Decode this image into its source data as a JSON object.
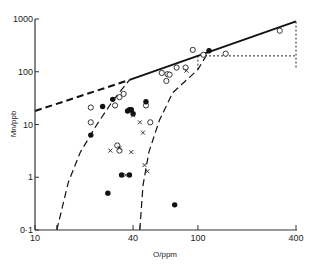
{
  "chart_data": {
    "type": "scatter",
    "title": "",
    "xlabel": "O/ppm",
    "ylabel": "Mn/ppb",
    "xscale": "log",
    "yscale": "log",
    "xlim": [
      10,
      400
    ],
    "ylim": [
      0.1,
      1000
    ],
    "grid": false,
    "legend": null,
    "x_ticks": [
      {
        "value": 10,
        "label": "10"
      },
      {
        "value": 40,
        "label": "40"
      },
      {
        "value": 100,
        "label": "100"
      },
      {
        "value": 400,
        "label": "400"
      }
    ],
    "x_minor_ticks": [
      13.6,
      44
    ],
    "y_ticks": [
      {
        "value": 1000,
        "label": "1000"
      },
      {
        "value": 100,
        "label": "100"
      },
      {
        "value": 10,
        "label": "10"
      },
      {
        "value": 1,
        "label": "1"
      },
      {
        "value": 0.1,
        "label": "0·1"
      }
    ],
    "series": [
      {
        "name": "open circles",
        "marker": "open-circle",
        "points": [
          [
            22,
            21
          ],
          [
            22,
            11
          ],
          [
            31,
            23
          ],
          [
            33,
            33
          ],
          [
            35,
            38
          ],
          [
            32,
            4.0
          ],
          [
            33,
            3.2
          ],
          [
            48,
            23
          ],
          [
            51,
            11
          ],
          [
            60,
            95
          ],
          [
            64,
            67
          ],
          [
            65,
            90
          ],
          [
            67,
            88
          ],
          [
            74,
            120
          ],
          [
            84,
            120
          ],
          [
            93,
            260
          ],
          [
            108,
            210
          ],
          [
            148,
            220
          ],
          [
            318,
            600
          ]
        ]
      },
      {
        "name": "filled circles",
        "marker": "filled-circle",
        "points": [
          [
            22,
            6.3
          ],
          [
            26,
            22
          ],
          [
            30,
            30
          ],
          [
            37,
            18
          ],
          [
            38,
            19
          ],
          [
            39,
            19
          ],
          [
            40,
            16
          ],
          [
            48,
            27
          ],
          [
            28,
            0.5
          ],
          [
            34,
            1.1
          ],
          [
            38,
            1.1
          ],
          [
            72,
            0.3
          ],
          [
            117,
            250
          ]
        ]
      },
      {
        "name": "crosses",
        "marker": "cross",
        "points": [
          [
            40,
            15
          ],
          [
            44,
            11
          ],
          [
            46,
            7
          ],
          [
            33,
            3.6
          ],
          [
            29,
            3.2
          ],
          [
            39,
            3.0
          ],
          [
            36,
            1.1
          ],
          [
            47,
            1.7
          ],
          [
            49,
            1.3
          ],
          [
            85,
            105
          ]
        ]
      }
    ],
    "lines": [
      {
        "name": "dashed upper boundary",
        "style": "dashed",
        "points": [
          [
            10,
            18
          ],
          [
            38,
            70
          ]
        ]
      },
      {
        "name": "solid upper boundary",
        "style": "solid",
        "points": [
          [
            38,
            70
          ],
          [
            400,
            900
          ]
        ]
      },
      {
        "name": "left dashed curve",
        "style": "dashed",
        "points": [
          [
            13.6,
            0.1
          ],
          [
            16,
            0.8
          ],
          [
            19,
            3
          ],
          [
            24,
            10
          ],
          [
            30,
            28
          ],
          [
            38,
            70
          ]
        ]
      },
      {
        "name": "right dashed curve",
        "style": "dashed",
        "points": [
          [
            44,
            0.1
          ],
          [
            46,
            0.7
          ],
          [
            50,
            3
          ],
          [
            58,
            12
          ],
          [
            70,
            40
          ],
          [
            100,
            110
          ],
          [
            117,
            250
          ]
        ]
      },
      {
        "name": "dotted horizontal reference",
        "style": "dotted",
        "points": [
          [
            117,
            200
          ],
          [
            400,
            200
          ]
        ]
      },
      {
        "name": "dotted vertical at 100",
        "style": "dotted",
        "points": [
          [
            100,
            110
          ],
          [
            100,
            200
          ]
        ]
      },
      {
        "name": "dotted vertical at 400",
        "style": "dotted",
        "points": [
          [
            400,
            120
          ],
          [
            400,
            900
          ]
        ]
      }
    ]
  },
  "labels": {
    "xlabel": "O/ppm",
    "ylabel": "Mn/ppb"
  }
}
